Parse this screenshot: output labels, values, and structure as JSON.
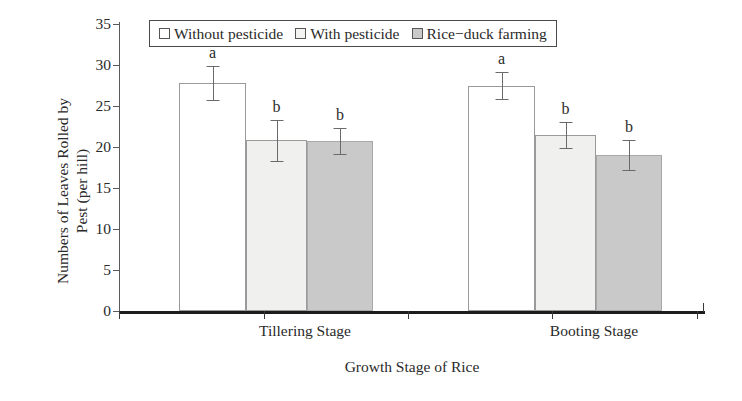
{
  "chart_data": {
    "type": "bar",
    "title": "",
    "xlabel": "Growth Stage of Rice",
    "ylabel_line1": "Numbers of Leaves Rolled by",
    "ylabel_line2": "Pest (per hill)",
    "categories": [
      "Tillering Stage",
      "Booting Stage"
    ],
    "ylim": [
      0,
      35
    ],
    "yticks": [
      0,
      5,
      10,
      15,
      20,
      25,
      30,
      35
    ],
    "ytick_labels": [
      "0",
      "5",
      "10",
      "15",
      "20",
      "25",
      "30",
      "35"
    ],
    "grid": false,
    "legend_position": "top-left",
    "series": [
      {
        "name": "Without pesticide",
        "swatch": "white",
        "values": [
          27.8,
          27.5
        ],
        "errors": [
          2.1,
          1.6
        ],
        "letters": [
          "a",
          "a"
        ]
      },
      {
        "name": "With pesticide",
        "swatch": "light",
        "values": [
          20.8,
          21.5
        ],
        "errors": [
          2.5,
          1.6
        ],
        "letters": [
          "b",
          "b"
        ]
      },
      {
        "name": "Rice−duck farming",
        "swatch": "grey",
        "values": [
          20.7,
          19.0
        ],
        "errors": [
          1.6,
          1.8
        ],
        "letters": [
          "b",
          "b"
        ]
      }
    ],
    "colors": {
      "without_pesticide": "#ffffff",
      "with_pesticide": "#f0f0ee",
      "rice_duck_farming": "#c9c9c9",
      "axis": "#1c1c1c",
      "text": "#2a2a2a",
      "error_bar": "#6a6a6a"
    }
  }
}
